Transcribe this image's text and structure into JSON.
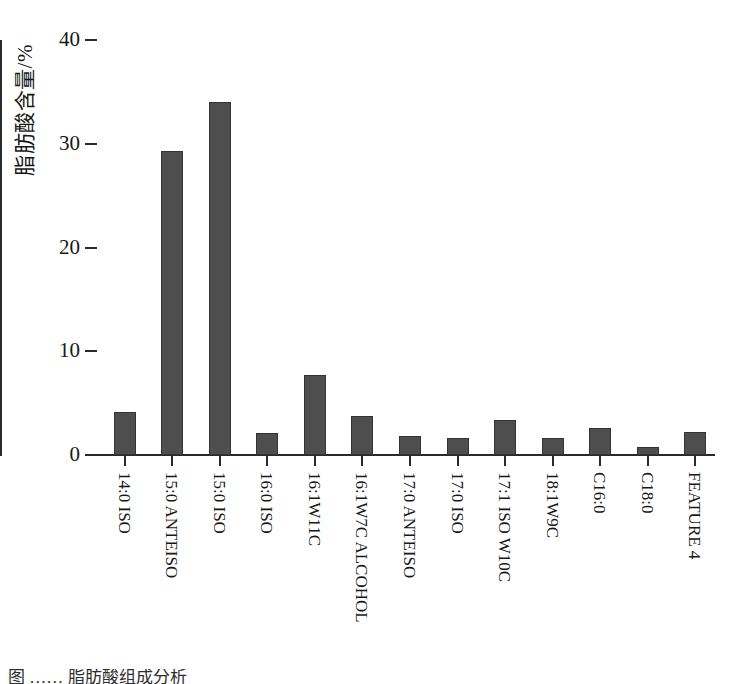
{
  "chart_data": {
    "type": "bar",
    "title": "",
    "subtitle": "",
    "xlabel": "",
    "ylabel": "脂肪酸含量/%",
    "ylim": [
      0,
      40
    ],
    "ytick_values": [
      0,
      10,
      20,
      30,
      40
    ],
    "ytick_labels": [
      "0",
      "10",
      "20",
      "30",
      "40"
    ],
    "grid": false,
    "legend": false,
    "legend_position": "none",
    "bar_color": "#4e4e4e",
    "bar_edge_color": "#333333",
    "axis_color": "#2a2a2a",
    "categories": [
      "14:0 ISO",
      "15:0 ANTEISO",
      "15:0 ISO",
      "16:0 ISO",
      "16:1W11C",
      "16:1W7C ALCOHOL",
      "17:0 ANTEISO",
      "17:0 ISO",
      "17:1 ISO W10C",
      "18:1W9C",
      "C16:0",
      "C18:0",
      "FEATURE 4"
    ],
    "values": [
      4.1,
      29.3,
      34.0,
      2.1,
      7.7,
      3.8,
      1.8,
      1.6,
      3.4,
      1.6,
      2.6,
      0.8,
      2.2
    ]
  },
  "caption": {
    "text": "图  ……  脂肪酸组成分析"
  }
}
